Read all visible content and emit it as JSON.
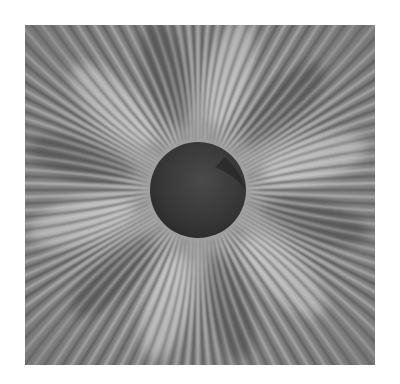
{
  "image": {
    "subject": "photoelastic stress fringe pattern radiating from a dark circular disc",
    "palette": {
      "background": "#ffffff",
      "fringe_light": "#d8d8d8",
      "fringe_mid": "#8a8a8a",
      "fringe_dark": "#4a4a4a",
      "disc": "#3a3a3a"
    }
  }
}
